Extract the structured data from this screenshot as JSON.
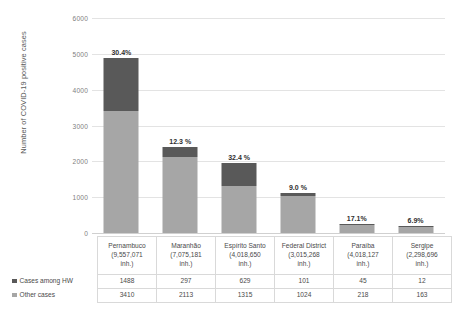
{
  "chart_data": {
    "type": "bar",
    "title": "",
    "xlabel": "",
    "ylabel": "Number of COVID-19 positive cases",
    "ylim": [
      0,
      6000
    ],
    "yticks": [
      0,
      1000,
      2000,
      3000,
      4000,
      5000,
      6000
    ],
    "ytick_labels": [
      "0",
      "1000",
      "2000",
      "3000",
      "4000",
      "5000",
      "6000"
    ],
    "grid": true,
    "stacked": true,
    "legend_position": "table-left",
    "categories": [
      "Pernambuco",
      "Maranhão",
      "Espírito Santo",
      "Federal District",
      "Paraíba",
      "Sergipe"
    ],
    "category_populations": [
      "(9,557,071 inh.)",
      "(7,075,181 inh.)",
      "(4,018,650 inh.)",
      "(3,015,268 inh.)",
      "(4,018,127 inh.)",
      "(2,298,696 inh.)"
    ],
    "series": [
      {
        "name": "Cases among HW",
        "color": "#595959",
        "values": [
          1488,
          297,
          629,
          101,
          45,
          12
        ]
      },
      {
        "name": "Other cases",
        "color": "#a6a6a6",
        "values": [
          3410,
          2113,
          1315,
          1024,
          218,
          163
        ]
      }
    ],
    "annotations": [
      "30.4%",
      "12.3 %",
      "32.4 %",
      "9.0 %",
      "17.1%",
      "6.9%"
    ]
  },
  "axis": {
    "y_title": "Number of COVID-19 positive cases",
    "ticks": [
      {
        "label": "6000",
        "value": 6000
      },
      {
        "label": "5000",
        "value": 5000
      },
      {
        "label": "4000",
        "value": 4000
      },
      {
        "label": "3000",
        "value": 3000
      },
      {
        "label": "2000",
        "value": 2000
      },
      {
        "label": "1000",
        "value": 1000
      },
      {
        "label": "0",
        "value": 0
      }
    ]
  },
  "legend": {
    "items": [
      {
        "label": "Cases among HW",
        "color": "#595959",
        "icon": "square-swatch-icon"
      },
      {
        "label": "Other cases",
        "color": "#a6a6a6",
        "icon": "square-swatch-icon"
      }
    ]
  },
  "table": {
    "row_labels": [
      "Cases among HW",
      "Other cases"
    ],
    "columns": [
      {
        "name": "Pernambuco",
        "population": "(9,557,071",
        "unit": "inh.)",
        "hw": "1488",
        "other": "3410",
        "pct": "30.4%"
      },
      {
        "name": "Maranhão",
        "population": "(7,075,181",
        "unit": "inh.)",
        "hw": "297",
        "other": "2113",
        "pct": "12.3 %"
      },
      {
        "name": "Espírito Santo",
        "population": "(4,018,650",
        "unit": "inh.)",
        "hw": "629",
        "other": "1315",
        "pct": "32.4 %"
      },
      {
        "name": "Federal District",
        "population": "(3,015,268",
        "unit": "inh.)",
        "hw": "101",
        "other": "1024",
        "pct": "9.0 %"
      },
      {
        "name": "Paraíba",
        "population": "(4,018,127",
        "unit": "inh.)",
        "hw": "45",
        "other": "218",
        "pct": "17.1%"
      },
      {
        "name": "Sergipe",
        "population": "(2,298,696",
        "unit": "inh.)",
        "hw": "12",
        "other": "163",
        "pct": "6.9%"
      }
    ]
  }
}
